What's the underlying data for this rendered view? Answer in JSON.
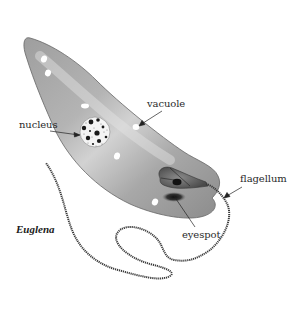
{
  "figure": {
    "title": "Euglena",
    "labels": {
      "nucleus": "nucleus",
      "vacuole": "vacuole",
      "flagellum": "flagellum",
      "eyespot": "eyespot"
    }
  },
  "colors": {
    "background": "#ffffff",
    "body_light": "#d6d6d6",
    "body_mid": "#a9a9a9",
    "body_dark": "#8a8a8a",
    "outline": "#555555",
    "nucleus_fill": "#f2f2f2",
    "granule": "#1a1a1a",
    "eyespot": "#1c1c1c",
    "flagellum": "#3a3a3a",
    "label_text": "#2a2a2a"
  }
}
